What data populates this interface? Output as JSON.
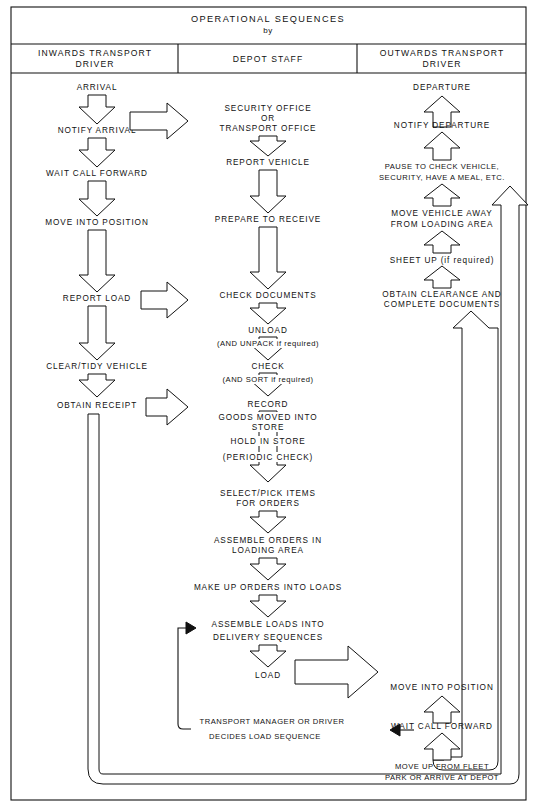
{
  "header": {
    "title": "OPERATIONAL  SEQUENCES",
    "by": "by",
    "columns": [
      {
        "id": "inwards",
        "line1": "INWARDS  TRANSPORT",
        "line2": "DRIVER"
      },
      {
        "id": "depot",
        "line1": "DEPOT  STAFF",
        "line2": ""
      },
      {
        "id": "outwards",
        "line1": "OUTWARDS  TRANSPORT",
        "line2": "DRIVER"
      }
    ]
  },
  "columns": {
    "inwards": {
      "steps": [
        {
          "id": "arrival",
          "lines": [
            "ARRIVAL"
          ]
        },
        {
          "id": "notify-arrival",
          "lines": [
            "NOTIFY  ARRIVAL"
          ]
        },
        {
          "id": "wait-call-forward",
          "lines": [
            "WAIT  CALL  FORWARD"
          ]
        },
        {
          "id": "move-into-position",
          "lines": [
            "MOVE  INTO  POSITION"
          ]
        },
        {
          "id": "report-load",
          "lines": [
            "REPORT  LOAD"
          ]
        },
        {
          "id": "clear-tidy-vehicle",
          "lines": [
            "CLEAR/TIDY  VEHICLE"
          ]
        },
        {
          "id": "obtain-receipt",
          "lines": [
            "OBTAIN  RECEIPT"
          ]
        }
      ]
    },
    "depot": {
      "steps": [
        {
          "id": "security-transport-office",
          "lines": [
            "SECURITY  OFFICE",
            "OR",
            "TRANSPORT  OFFICE"
          ]
        },
        {
          "id": "report-vehicle",
          "lines": [
            "REPORT  VEHICLE"
          ]
        },
        {
          "id": "prepare-to-receive",
          "lines": [
            "PREPARE  TO  RECEIVE"
          ]
        },
        {
          "id": "check-documents",
          "lines": [
            "CHECK  DOCUMENTS"
          ]
        },
        {
          "id": "unload",
          "lines": [
            "UNLOAD",
            "(AND  UNPACK  if  required)"
          ]
        },
        {
          "id": "check-sort",
          "lines": [
            "CHECK",
            "(AND  SORT  if required)"
          ]
        },
        {
          "id": "record",
          "lines": [
            "RECORD"
          ]
        },
        {
          "id": "goods-moved-into-store",
          "lines": [
            "GOODS  MOVED  INTO",
            "STORE"
          ]
        },
        {
          "id": "hold-in-store",
          "lines": [
            "HOLD  IN  STORE"
          ]
        },
        {
          "id": "periodic-check",
          "lines": [
            "(PERIODIC  CHECK)"
          ]
        },
        {
          "id": "select-pick-items",
          "lines": [
            "SELECT/PICK  ITEMS",
            "FOR  ORDERS"
          ]
        },
        {
          "id": "assemble-orders",
          "lines": [
            "ASSEMBLE  ORDERS  IN",
            "LOADING  AREA"
          ]
        },
        {
          "id": "make-up-orders",
          "lines": [
            "MAKE UP ORDERS INTO LOADS"
          ]
        },
        {
          "id": "assemble-loads",
          "lines": [
            "ASSEMBLE  LOADS  INTO",
            "DELIVERY  SEQUENCES"
          ]
        },
        {
          "id": "load",
          "lines": [
            "LOAD"
          ]
        },
        {
          "id": "transport-manager",
          "lines": [
            "TRANSPORT  MANAGER  OR  DRIVER",
            "DECIDES  LOAD  SEQUENCE"
          ]
        }
      ]
    },
    "outwards": {
      "steps": [
        {
          "id": "departure",
          "lines": [
            "DEPARTURE"
          ]
        },
        {
          "id": "notify-departure",
          "lines": [
            "NOTIFY  DEPARTURE"
          ]
        },
        {
          "id": "pause-to-check",
          "lines": [
            "PAUSE  TO  CHECK  VEHICLE,",
            "SECURITY,  HAVE  A  MEAL,  ETC."
          ]
        },
        {
          "id": "move-vehicle-away",
          "lines": [
            "MOVE  VEHICLE  AWAY",
            "FROM  LOADING  AREA"
          ]
        },
        {
          "id": "sheet-up",
          "lines": [
            "SHEET  UP  (if  required)"
          ]
        },
        {
          "id": "obtain-clearance",
          "lines": [
            "OBTAIN  CLEARANCE  AND",
            "COMPLETE  DOCUMENTS"
          ]
        },
        {
          "id": "move-into-position-out",
          "lines": [
            "MOVE  INTO  POSITION"
          ]
        },
        {
          "id": "wait-call-forward-out",
          "lines": [
            "WAIT  CALL  FORWARD"
          ]
        },
        {
          "id": "move-up-fleet-park",
          "lines": [
            "MOVE  UP  FROM  FLEET",
            "PARK  OR  ARRIVE  AT  DEPOT"
          ]
        }
      ]
    }
  },
  "colors": {
    "ink": "#111111",
    "paper": "#ffffff"
  }
}
